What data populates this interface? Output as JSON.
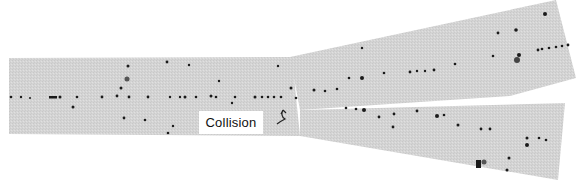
{
  "figure": {
    "label": "Collision",
    "colors": {
      "background": "#ffffff",
      "strip": "#d6d6d6",
      "track_dot": "#1a1a1a"
    }
  }
}
